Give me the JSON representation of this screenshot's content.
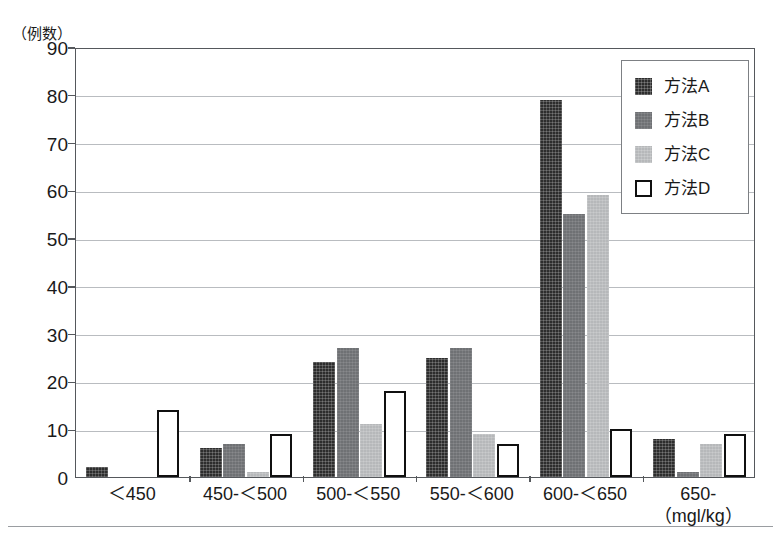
{
  "chart_data": {
    "type": "bar",
    "title": "",
    "subtitle": "",
    "xlabel": "(mgl/kg)",
    "ylabel": "(例数)",
    "categories": [
      "＜450",
      "450-＜500",
      "500-＜550",
      "550-＜600",
      "600-＜650",
      "650-"
    ],
    "series": [
      {
        "name": "方法A",
        "values": [
          2,
          6,
          24,
          25,
          79,
          8
        ],
        "color": "#2d2d2d",
        "style": "dark-crosshatch"
      },
      {
        "name": "方法B",
        "values": [
          0,
          7,
          27,
          27,
          55,
          1
        ],
        "color": "#6f7174",
        "style": "medium-gray"
      },
      {
        "name": "方法C",
        "values": [
          0,
          1,
          11,
          9,
          59,
          7
        ],
        "color": "#b6b8ba",
        "style": "light-gray"
      },
      {
        "name": "方法D",
        "values": [
          14,
          9,
          18,
          7,
          10,
          9
        ],
        "color": "#ffffff",
        "style": "white-outlined"
      }
    ],
    "ylim": [
      0,
      90
    ],
    "yticks": [
      0,
      10,
      20,
      30,
      40,
      50,
      60,
      70,
      80,
      90
    ],
    "grid": true,
    "legend_position": "top-right"
  },
  "axes": {
    "y_unit_caption": "（例数）",
    "x_unit_caption": "（mgl/kg）"
  },
  "legend": {
    "entries": [
      {
        "label": "方法A",
        "swatch": "dark-crosshatch-swatch"
      },
      {
        "label": "方法B",
        "swatch": "medium-gray-swatch"
      },
      {
        "label": "方法C",
        "swatch": "light-gray-swatch"
      },
      {
        "label": "方法D",
        "swatch": "white-outlined-swatch"
      }
    ]
  }
}
